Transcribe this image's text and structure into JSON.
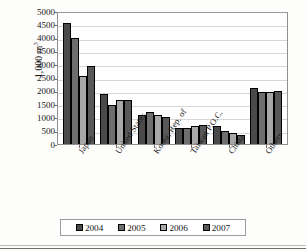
{
  "chart_data": {
    "type": "bar",
    "title": "",
    "xlabel": "",
    "ylabel": "1,000 m",
    "ylabel_sup": "3",
    "ylim": [
      0,
      5000
    ],
    "ytick_step": 500,
    "yticks": [
      "5000",
      "4500",
      "4000",
      "3500",
      "3000",
      "2500",
      "2000",
      "1500",
      "1000",
      "500",
      "0"
    ],
    "grid": true,
    "legend_position": "bottom",
    "categories": [
      "Japan",
      "United States",
      "Korea, Rep. of",
      "Taiwan P.O.C.",
      "China",
      "Others"
    ],
    "series": [
      {
        "name": "2004",
        "color": "#4a4a4a",
        "values": [
          4550,
          1890,
          1090,
          610,
          680,
          2090
        ]
      },
      {
        "name": "2005",
        "color": "#6e6e6e",
        "values": [
          4000,
          1480,
          1210,
          620,
          500,
          1950
        ]
      },
      {
        "name": "2006",
        "color": "#a8a8a8",
        "values": [
          2570,
          1650,
          1080,
          670,
          410,
          1960
        ]
      },
      {
        "name": "2007",
        "color": "#585858",
        "values": [
          2920,
          1650,
          1030,
          730,
          330,
          1990
        ]
      }
    ]
  }
}
